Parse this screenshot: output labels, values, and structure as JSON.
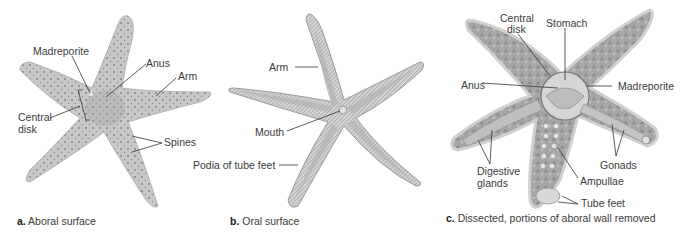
{
  "figure": {
    "panels": [
      {
        "letter": "a.",
        "caption": "Aboral surface",
        "labels": {
          "madreporite": "Madreporite",
          "anus": "Anus",
          "arm": "Arm",
          "central_disk_line1": "Central",
          "central_disk_line2": "disk",
          "spines": "Spines"
        }
      },
      {
        "letter": "b.",
        "caption": "Oral surface",
        "labels": {
          "arm": "Arm",
          "mouth": "Mouth",
          "podia": "Podia of tube feet"
        }
      },
      {
        "letter": "c.",
        "caption": "Dissected, portions of aboral wall removed",
        "labels": {
          "central_disk_line1": "Central",
          "central_disk_line2": "disk",
          "stomach": "Stomach",
          "anus": "Anus",
          "madreporite": "Madreporite",
          "digestive_glands_line1": "Digestive",
          "digestive_glands_line2": "glands",
          "gonads": "Gonads",
          "ampullae": "Ampullae",
          "tube_feet": "Tube feet"
        }
      }
    ],
    "colors": {
      "body_fill": "#c9c9c9",
      "body_dark": "#a8a8a8",
      "outline": "#9a9a9a",
      "leader_line": "#333333",
      "text": "#3a3a3a"
    }
  }
}
